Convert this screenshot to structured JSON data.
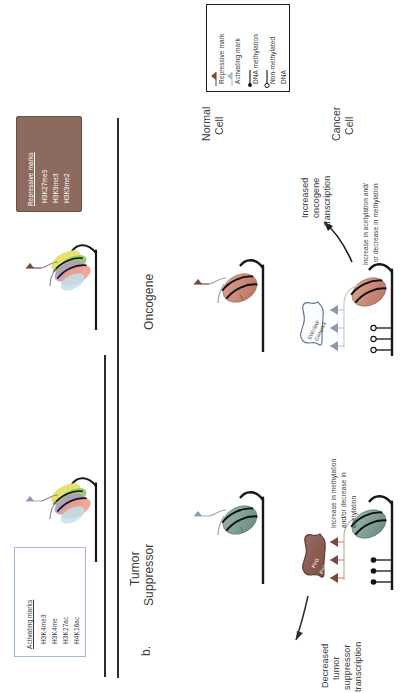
{
  "figure": {
    "panel_label": "b.",
    "gene_columns": [
      {
        "id": "oncogene",
        "label": "Oncogene"
      },
      {
        "id": "tumor-suppressor",
        "label": "Tumor\nSuppressor"
      }
    ],
    "cell_rows": [
      {
        "id": "normal",
        "label": "Normal\nCell"
      },
      {
        "id": "cancer",
        "label": "Cancer\nCell"
      }
    ]
  },
  "repressive_box": {
    "title": "Repressive marks",
    "marks": [
      "H3K27me3",
      "H3K9me3",
      "H3K9me2"
    ],
    "fill": "#8d6a5f",
    "border": "#6f4f45",
    "text_color": "#ffffff"
  },
  "activating_box": {
    "title": "Activating marks",
    "marks": [
      "H3K4me3",
      "H3K4me",
      "H3K27ac",
      "H4K16ac"
    ],
    "fill": "#ffffff",
    "border": "#9fb6d4",
    "text_color": "#3a3a3a"
  },
  "legend": {
    "items": [
      {
        "icon": "repressive-mark-flag-icon",
        "label": "Repressive mark",
        "color": "#7b4a3f"
      },
      {
        "icon": "activating-mark-flag-icon",
        "label": "Activating mark",
        "color": "#a9bdd2"
      },
      {
        "icon": "dna-methylation-lollipop-filled-icon",
        "label": "DNA methylation",
        "color": "#111111"
      },
      {
        "icon": "non-methylated-dna-lollipop-open-icon",
        "label": "Non-methylated\nDNA",
        "color": "#111111"
      }
    ],
    "border": "#1c1c1c"
  },
  "oncogene_panel": {
    "normal": {
      "nucleosome_color": "#c98a78",
      "mark": "repressive-mark-flag-icon"
    },
    "cancer": {
      "nucleosome_color": "#c98a78",
      "complex_label": "SWI/SNF\nComplex",
      "marks": "activating-mark-flag-icon",
      "dna_state": "non-methylated",
      "change_note": "Increase in acetylation and/\nor decrease in methylation",
      "outcome": "Increased\noncogene\ntranscription"
    }
  },
  "tumor_suppressor_panel": {
    "normal": {
      "nucleosome_color": "#7f9e95",
      "mark": "activating-mark-flag-icon"
    },
    "cancer": {
      "nucleosome_color": "#7f9e95",
      "complex_label": "PcG\nProtein",
      "marks": "repressive-mark-flag-icon",
      "dna_state": "methylated",
      "change_note": "Increase in methylation\nand/or decrease in\nacetylation",
      "outcome": "Decreased\ntumor\nsuppressor\ntranscription"
    }
  },
  "colors": {
    "ink": "#3a3a3a",
    "strand": "#181818",
    "repressive": "#7b4a3f",
    "activating": "#a9bdd2",
    "onco_nucleosome": "#c98a78",
    "ts_nucleosome": "#7f9e95"
  }
}
